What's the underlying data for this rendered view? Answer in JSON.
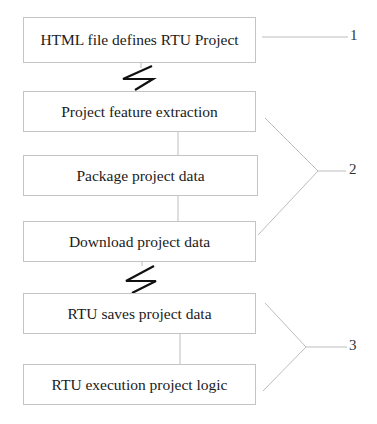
{
  "diagram": {
    "steps": [
      {
        "label": "HTML file defines RTU Project"
      },
      {
        "label": "Project feature extraction"
      },
      {
        "label": "Package project data"
      },
      {
        "label": "Download project data"
      },
      {
        "label": "RTU saves project data"
      },
      {
        "label": "RTU execution project logic"
      }
    ],
    "reference_labels": [
      "1",
      "2",
      "3"
    ],
    "connectors": {
      "lightning_1": "between step 1 and step 2",
      "lightning_2": "between step 4 and step 5"
    },
    "groups": [
      {
        "label": "1",
        "steps": [
          0
        ]
      },
      {
        "label": "2",
        "steps": [
          1,
          2,
          3
        ]
      },
      {
        "label": "3",
        "steps": [
          4,
          5
        ]
      }
    ]
  }
}
